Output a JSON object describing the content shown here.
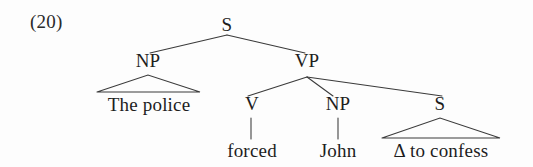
{
  "figure": {
    "example_number": "(20)",
    "kind": "phrase-structure-tree",
    "sentence": "The police forced John Δ to confess"
  },
  "tree": {
    "root": {
      "label": "S",
      "x": 227,
      "y": 30
    },
    "nodes": [
      {
        "id": "s-root",
        "label": "S",
        "x": 227,
        "y": 30,
        "type": "nonterminal"
      },
      {
        "id": "np-subj",
        "label": "NP",
        "x": 148,
        "y": 66,
        "type": "nonterminal"
      },
      {
        "id": "vp",
        "label": "VP",
        "x": 307,
        "y": 66,
        "type": "nonterminal"
      },
      {
        "id": "v",
        "label": "V",
        "x": 252,
        "y": 109,
        "type": "nonterminal"
      },
      {
        "id": "np-obj",
        "label": "NP",
        "x": 338,
        "y": 109,
        "type": "nonterminal"
      },
      {
        "id": "s-embed",
        "label": "S",
        "x": 440,
        "y": 109,
        "type": "nonterminal"
      }
    ],
    "terminals": [
      {
        "id": "the-police",
        "label": "The police",
        "x": 148,
        "y": 110,
        "parent": "np-subj",
        "triangle": true
      },
      {
        "id": "forced",
        "label": "forced",
        "x": 252,
        "y": 156,
        "parent": "v",
        "triangle": false
      },
      {
        "id": "john",
        "label": "John",
        "x": 338,
        "y": 156,
        "parent": "np-obj",
        "triangle": false
      },
      {
        "id": "delta-confess",
        "label": "Δ to confess",
        "x": 441,
        "y": 156,
        "parent": "s-embed",
        "triangle": true
      }
    ],
    "triangles": [
      {
        "id": "np-subj-triangle",
        "apex_x": 148,
        "apex_y": 75,
        "left_x": 97,
        "right_x": 200,
        "base_y": 92
      },
      {
        "id": "s-embed-triangle",
        "apex_x": 440,
        "apex_y": 118,
        "left_x": 382,
        "right_x": 500,
        "base_y": 138
      }
    ],
    "branches": [
      {
        "id": "s-to-np",
        "from": "s-root",
        "to": "np-subj",
        "x1": 227,
        "y1": 35,
        "x2": 150,
        "y2": 53
      },
      {
        "id": "s-to-vp",
        "from": "s-root",
        "to": "vp",
        "x1": 227,
        "y1": 35,
        "x2": 305,
        "y2": 53
      },
      {
        "id": "vp-to-v",
        "from": "vp",
        "to": "v",
        "x1": 307,
        "y1": 77,
        "x2": 248,
        "y2": 96
      },
      {
        "id": "vp-to-np",
        "from": "vp",
        "to": "np-obj",
        "x1": 307,
        "y1": 77,
        "x2": 333,
        "y2": 96
      },
      {
        "id": "vp-to-s",
        "from": "vp",
        "to": "s-embed",
        "x1": 307,
        "y1": 77,
        "x2": 442,
        "y2": 96
      },
      {
        "id": "v-stem",
        "from": "v",
        "to": "forced",
        "x1": 251,
        "y1": 118,
        "x2": 251,
        "y2": 139
      },
      {
        "id": "np-stem",
        "from": "np-obj",
        "to": "john",
        "x1": 338,
        "y1": 118,
        "x2": 338,
        "y2": 139
      }
    ]
  },
  "colors": {
    "background": "#fdfdfd",
    "ink": "#1d1d1d",
    "line": "#3a3a3a"
  }
}
